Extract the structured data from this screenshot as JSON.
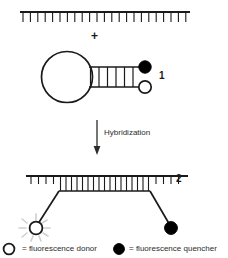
{
  "figure": {
    "plus_sign": "+",
    "process_label": "Hybridization",
    "structure_labels": {
      "hairpin": "1",
      "duplex": "2"
    },
    "legend": {
      "donor": {
        "marker": "open-circle",
        "text": "= fluorescence donor"
      },
      "quencher": {
        "marker": "filled-circle",
        "text": "= fluorescence quencher"
      }
    },
    "colors": {
      "stroke": "#1a1a1a",
      "fill_quencher": "#000000",
      "fill_donor": "#ffffff",
      "burst_rays": "#cfcfcf",
      "background": "#ffffff"
    },
    "structures": {
      "target_strand": {
        "name": "target-strand",
        "tick_count": 23
      },
      "beacon_hairpin": {
        "name": "beacon-hairpin",
        "stem_rung_count": 5,
        "loop_shape": "circle"
      },
      "hybrid_duplex": {
        "name": "hybrid-duplex",
        "paired_rung_count": 17,
        "free_tick_count_left": 4,
        "free_tick_count_right": 4
      }
    }
  }
}
